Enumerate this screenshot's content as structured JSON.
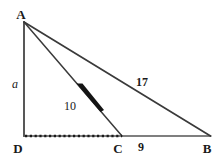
{
  "figure": {
    "background_color": "#ffffff",
    "stroke_color": "#333333",
    "label_color": "#1a1a1a"
  },
  "vertices": [
    {
      "id": "A",
      "label": "A",
      "x": 24,
      "y": 22,
      "label_x": 21,
      "label_y": 14
    },
    {
      "id": "D",
      "label": "D",
      "x": 24,
      "y": 136,
      "label_x": 18,
      "label_y": 148
    },
    {
      "id": "C",
      "label": "C",
      "x": 122,
      "y": 136,
      "label_x": 118,
      "label_y": 148
    },
    {
      "id": "B",
      "label": "B",
      "x": 210,
      "y": 136,
      "label_x": 207,
      "label_y": 148
    }
  ],
  "segments": [
    {
      "id": "AD",
      "from": "A",
      "to": "D",
      "style": "solid",
      "width": 1.6
    },
    {
      "id": "DB",
      "from": "D",
      "to": "B",
      "style": "solid",
      "width": 1.6
    },
    {
      "id": "AB",
      "from": "A",
      "to": "B",
      "style": "solid",
      "width": 1.6
    },
    {
      "id": "AC",
      "from": "A",
      "to": "C",
      "style": "solid",
      "width": 1.5
    },
    {
      "id": "DC",
      "from": "D",
      "to": "C",
      "style": "dashed",
      "width": 2.4
    }
  ],
  "measure_labels": [
    {
      "id": "side-a",
      "text": "a",
      "segment": "AD",
      "x": 15,
      "y": 84,
      "weight": "italic"
    },
    {
      "id": "side-10",
      "text": "10",
      "segment": "AC",
      "x": 70,
      "y": 106,
      "weight": "plain"
    },
    {
      "id": "side-17",
      "text": "17",
      "segment": "AB",
      "x": 142,
      "y": 82,
      "weight": "bold"
    },
    {
      "id": "side-9",
      "text": "9",
      "segment": "CB",
      "x": 141,
      "y": 147,
      "weight": "bold"
    }
  ]
}
